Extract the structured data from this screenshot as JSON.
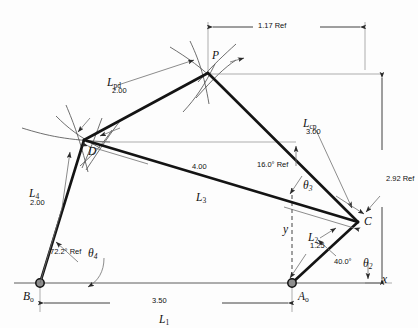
{
  "figure": {
    "type": "kinematic-linkage-diagram",
    "title": "",
    "ink_color": "#1a1a1a",
    "thin_color": "#6b6b6b",
    "points": {
      "P": {
        "label": "P",
        "x": 208,
        "y": 73
      },
      "D": {
        "label": "D",
        "x": 84,
        "y": 140
      },
      "C": {
        "label": "C",
        "x": 358,
        "y": 222
      },
      "Ao": {
        "label": "A",
        "sub": "o",
        "x": 292,
        "y": 283
      },
      "Bo": {
        "label": "B",
        "sub": "o",
        "x": 40,
        "y": 283
      }
    },
    "links": [
      {
        "name": "L",
        "sub": "1",
        "value": "3.50",
        "from": "Bo",
        "to": "Ao"
      },
      {
        "name": "L",
        "sub": "2",
        "value": "1.25",
        "from": "Ao",
        "to": "C"
      },
      {
        "name": "L",
        "sub": "3",
        "value": "4.00",
        "from": "C",
        "to": "D"
      },
      {
        "name": "L",
        "sub": "4",
        "value": "2.00",
        "from": "D",
        "to": "Bo"
      },
      {
        "name": "L",
        "sub": "pd",
        "value": "2.00",
        "from": "P",
        "to": "D"
      },
      {
        "name": "L",
        "sub": "cp",
        "value": "3.00",
        "from": "C",
        "to": "P"
      }
    ],
    "angles": [
      {
        "name": "theta",
        "sub": "2",
        "value": "40.0°"
      },
      {
        "name": "theta",
        "sub": "3",
        "value": "16.0°",
        "ref": "Ref"
      },
      {
        "name": "theta",
        "sub": "4",
        "value": "72.2°",
        "ref": "Ref"
      }
    ],
    "dimensions": [
      {
        "id": "top-horizontal",
        "value": "1.17 Ref"
      },
      {
        "id": "right-vertical",
        "value": "2.92 Ref"
      },
      {
        "id": "bottom-horizontal",
        "value": "3.50"
      },
      {
        "id": "link3-length",
        "value": "4.00"
      }
    ],
    "axes": {
      "x_label": "x",
      "y_label": "y"
    },
    "labels": {
      "dim_117": "1.17 Ref",
      "dim_292": "2.92 Ref",
      "dim_350": "3.50",
      "dim_400": "4.00",
      "ang_16": "16.0° Ref",
      "ang_722": "72.2° Ref",
      "ang_40": "40.0°",
      "val_Lpd": "2.00",
      "val_Lcp": "3.00",
      "val_L4": "2.00",
      "val_L2": "1.25",
      "L_letter": "L",
      "theta_letter": "θ",
      "sub_1": "1",
      "sub_2": "2",
      "sub_3": "3",
      "sub_4": "4",
      "sub_pd": "pd",
      "sub_cp": "cp",
      "sub_o": "o",
      "pt_P": "P",
      "pt_D": "D",
      "pt_C": "C",
      "pt_A": "A",
      "pt_B": "B",
      "axis_x": "x",
      "axis_y": "y"
    }
  }
}
